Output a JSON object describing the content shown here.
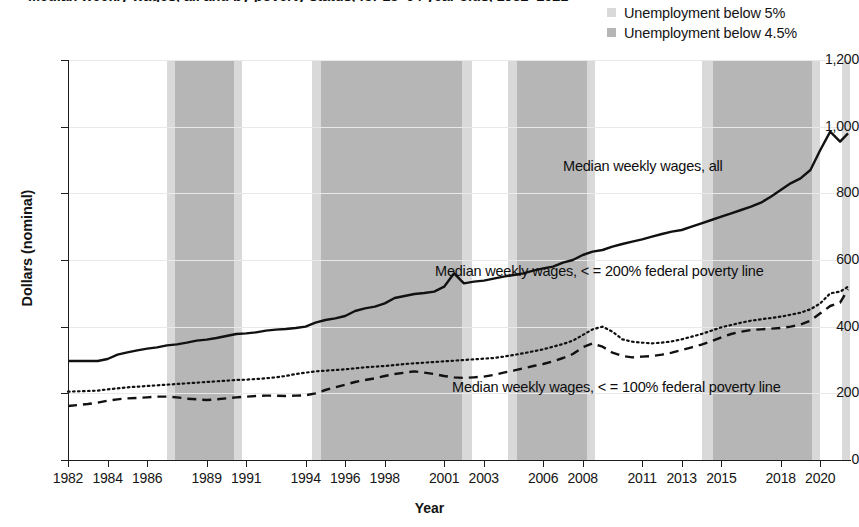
{
  "title": "Median weekly wages, all and by poverty status, for 18–64 year olds, 1982–2021",
  "legend": {
    "items": [
      {
        "label": "Unemployment below 5%",
        "color": "#d9d9d9",
        "name": "unemployment-below-5"
      },
      {
        "label": "Unemployment below 4.5%",
        "color": "#b6b6b6",
        "name": "unemployment-below-4-5"
      }
    ]
  },
  "axes": {
    "ylabel": "Dollars (nominal)",
    "xlabel": "Year",
    "yticks": [
      "0",
      "200",
      "400",
      "600",
      "800",
      "1,000",
      "1,200"
    ],
    "xticks": [
      "1982",
      "1984",
      "1986",
      "1989",
      "1991",
      "1994",
      "1996",
      "1998",
      "2001",
      "2003",
      "2006",
      "2008",
      "2011",
      "2013",
      "2015",
      "2018",
      "2020"
    ]
  },
  "annotations": {
    "all": "Median weekly wages, all",
    "fpl200": "Median weekly wages, < = 200% federal poverty line",
    "fpl100": "Median weekly wages, < = 100% federal poverty line"
  },
  "chart_data": {
    "type": "line",
    "title": "Median weekly wages, all and by poverty status, for 18–64 year olds, 1982–2021",
    "xlabel": "Year",
    "ylabel": "Dollars (nominal)",
    "ylim": [
      0,
      1200
    ],
    "xlim": [
      1982,
      2021.5
    ],
    "grid": true,
    "legend_position": "top-right",
    "x": [
      1982,
      1982.5,
      1983,
      1983.5,
      1984,
      1984.5,
      1985,
      1985.5,
      1986,
      1986.5,
      1987,
      1987.5,
      1988,
      1988.5,
      1989,
      1989.5,
      1990,
      1990.5,
      1991,
      1991.5,
      1992,
      1992.5,
      1993,
      1993.5,
      1994,
      1994.5,
      1995,
      1995.5,
      1996,
      1996.5,
      1997,
      1997.5,
      1998,
      1998.5,
      1999,
      1999.5,
      2000,
      2000.5,
      2001,
      2001.5,
      2002,
      2002.5,
      2003,
      2003.5,
      2004,
      2004.5,
      2005,
      2005.5,
      2006,
      2006.5,
      2007,
      2007.5,
      2008,
      2008.5,
      2009,
      2009.5,
      2010,
      2010.5,
      2011,
      2011.5,
      2012,
      2012.5,
      2013,
      2013.5,
      2014,
      2014.5,
      2015,
      2015.5,
      2016,
      2016.5,
      2017,
      2017.5,
      2018,
      2018.5,
      2019,
      2019.5,
      2020,
      2020.5,
      2021,
      2021.4
    ],
    "series": [
      {
        "name": "Median weekly wages, all",
        "style": "solid",
        "color": "#111111",
        "values": [
          297,
          297,
          297,
          297,
          303,
          316,
          323,
          329,
          334,
          338,
          344,
          347,
          352,
          358,
          361,
          366,
          372,
          378,
          380,
          383,
          388,
          391,
          393,
          396,
          400,
          412,
          420,
          425,
          432,
          447,
          455,
          460,
          470,
          486,
          492,
          498,
          501,
          505,
          520,
          560,
          530,
          535,
          538,
          544,
          550,
          555,
          560,
          568,
          575,
          580,
          592,
          600,
          615,
          625,
          630,
          640,
          648,
          655,
          662,
          670,
          678,
          685,
          690,
          700,
          710,
          720,
          730,
          740,
          750,
          760,
          772,
          790,
          810,
          830,
          845,
          870,
          930,
          985,
          955,
          980
        ]
      },
      {
        "name": "Median weekly wages, < = 200% federal poverty line",
        "style": "dotted",
        "color": "#111111",
        "values": [
          205,
          206,
          207,
          208,
          212,
          215,
          218,
          220,
          222,
          224,
          226,
          228,
          230,
          232,
          234,
          236,
          238,
          240,
          241,
          243,
          245,
          248,
          252,
          258,
          262,
          266,
          268,
          270,
          272,
          275,
          278,
          280,
          282,
          285,
          288,
          290,
          292,
          294,
          296,
          298,
          300,
          302,
          304,
          306,
          310,
          315,
          320,
          326,
          332,
          340,
          348,
          358,
          375,
          392,
          400,
          385,
          362,
          355,
          352,
          350,
          352,
          356,
          362,
          370,
          378,
          388,
          398,
          405,
          412,
          418,
          422,
          426,
          430,
          436,
          442,
          452,
          470,
          500,
          505,
          520
        ]
      },
      {
        "name": "Median weekly wages, < = 100% federal poverty line",
        "style": "dashed",
        "color": "#111111",
        "values": [
          162,
          165,
          168,
          172,
          178,
          182,
          185,
          186,
          188,
          190,
          190,
          188,
          184,
          182,
          180,
          182,
          185,
          188,
          190,
          192,
          193,
          193,
          192,
          193,
          194,
          200,
          210,
          218,
          226,
          234,
          240,
          245,
          252,
          258,
          262,
          266,
          262,
          258,
          252,
          248,
          246,
          248,
          250,
          255,
          262,
          268,
          275,
          282,
          288,
          296,
          306,
          318,
          338,
          350,
          340,
          322,
          312,
          308,
          310,
          312,
          316,
          322,
          330,
          338,
          346,
          356,
          368,
          378,
          385,
          390,
          392,
          394,
          396,
          400,
          406,
          418,
          440,
          462,
          472,
          512
        ]
      }
    ],
    "shaded_bands": [
      {
        "label": "Unemployment below 5%",
        "x_start": 1987.0,
        "x_end": 1987.4,
        "shade": "light"
      },
      {
        "label": "Unemployment below 4.5%",
        "x_start": 1987.4,
        "x_end": 1990.4,
        "shade": "dark"
      },
      {
        "label": "Unemployment below 5%",
        "x_start": 1990.4,
        "x_end": 1990.8,
        "shade": "light"
      },
      {
        "label": "Unemployment below 5%",
        "x_start": 1994.3,
        "x_end": 1994.8,
        "shade": "light"
      },
      {
        "label": "Unemployment below 4.5%",
        "x_start": 1994.8,
        "x_end": 2001.9,
        "shade": "dark"
      },
      {
        "label": "Unemployment below 5%",
        "x_start": 2001.9,
        "x_end": 2002.4,
        "shade": "light"
      },
      {
        "label": "Unemployment below 5%",
        "x_start": 2004.2,
        "x_end": 2004.7,
        "shade": "light"
      },
      {
        "label": "Unemployment below 4.5%",
        "x_start": 2004.7,
        "x_end": 2008.2,
        "shade": "dark"
      },
      {
        "label": "Unemployment below 5%",
        "x_start": 2008.2,
        "x_end": 2008.6,
        "shade": "light"
      },
      {
        "label": "Unemployment below 5%",
        "x_start": 2014.0,
        "x_end": 2014.6,
        "shade": "light"
      },
      {
        "label": "Unemployment below 4.5%",
        "x_start": 2014.6,
        "x_end": 2019.6,
        "shade": "dark"
      },
      {
        "label": "Unemployment below 5%",
        "x_start": 2019.6,
        "x_end": 2020.0,
        "shade": "light"
      },
      {
        "label": "Unemployment below 5%",
        "x_start": 2021.1,
        "x_end": 2021.5,
        "shade": "light"
      }
    ],
    "annotations": [
      {
        "text": "Median weekly wages, all",
        "x": 2010.2,
        "y": 880
      },
      {
        "text": "Median weekly wages, < = 200% federal poverty line",
        "x": 2003.5,
        "y": 600
      },
      {
        "text": "Median weekly wages, < = 100% federal poverty line",
        "x": 2004.5,
        "y": 252
      }
    ]
  }
}
